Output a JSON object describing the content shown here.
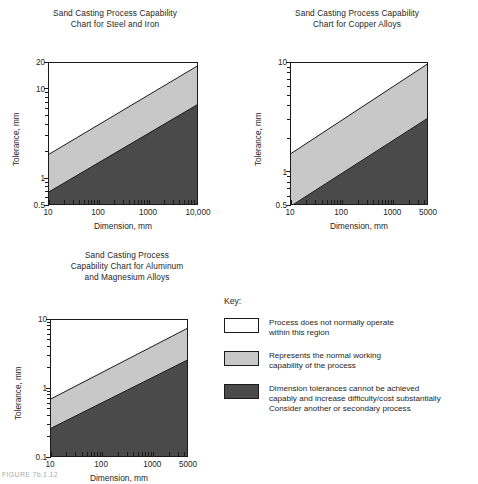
{
  "figure": {
    "footer_fragment": "FIGURE 7b.1.12"
  },
  "palette": {
    "white_region": "#ffffff",
    "normal_region": "#c8c8c8",
    "difficult_region": "#4a4a4a",
    "line": "#1a1a1a",
    "text": "#262626"
  },
  "key": {
    "title": "Key:",
    "items": [
      {
        "swatch": "#ffffff",
        "text": "Process does not normally operate\nwithin this region"
      },
      {
        "swatch": "#c8c8c8",
        "text": "Represents the normal working\ncapability of the process"
      },
      {
        "swatch": "#4a4a4a",
        "text": "Dimension tolerances cannot be achieved\ncapably and increase difficulty/cost substantially\nConsider another or secondary process"
      }
    ]
  },
  "chart_data": [
    {
      "id": "steel-and-iron",
      "type": "area",
      "title": "Sand Casting Process Capability\nChart for Steel and Iron",
      "xlabel": "Dimension, mm",
      "ylabel": "Tolerance, mm",
      "xscale": "log",
      "yscale": "log",
      "xlim": [
        10,
        10000
      ],
      "ylim": [
        0.5,
        20
      ],
      "xticks": [
        10,
        100,
        1000,
        10000
      ],
      "xticklabels": [
        "10",
        "100",
        "1000",
        "10,000"
      ],
      "yticks": [
        0.5,
        1,
        10,
        20
      ],
      "yticklabels": [
        "0.5",
        "1",
        "10",
        "20"
      ],
      "grid": false,
      "legend": "external-key",
      "boundaries": [
        {
          "name": "upper boundary (white / normal working)",
          "points": [
            [
              10,
              1.9
            ],
            [
              10000,
              19.0
            ]
          ]
        },
        {
          "name": "lower boundary (normal working / difficult)",
          "points": [
            [
              10,
              0.72
            ],
            [
              10000,
              7.0
            ]
          ]
        }
      ],
      "regions": [
        {
          "name": "Process does not normally operate",
          "fill": "#ffffff"
        },
        {
          "name": "Normal working capability",
          "fill": "#c8c8c8"
        },
        {
          "name": "Tolerances cannot be achieved capably",
          "fill": "#4a4a4a"
        }
      ]
    },
    {
      "id": "copper-alloys",
      "type": "area",
      "title": "Sand Casting Process Capability\nChart for Copper Alloys",
      "xlabel": "Dimension, mm",
      "ylabel": "Tolerance, mm",
      "xscale": "log",
      "yscale": "log",
      "xlim": [
        10,
        5000
      ],
      "ylim": [
        0.5,
        10
      ],
      "xticks": [
        10,
        100,
        1000,
        5000
      ],
      "xticklabels": [
        "10",
        "100",
        "1000",
        "5000"
      ],
      "yticks": [
        0.5,
        1,
        10
      ],
      "yticklabels": [
        "0.5",
        "1",
        "10"
      ],
      "grid": false,
      "legend": "external-key",
      "boundaries": [
        {
          "name": "upper boundary (white / normal working)",
          "points": [
            [
              10,
              1.5
            ],
            [
              5000,
              10.0
            ]
          ]
        },
        {
          "name": "lower boundary (normal working / difficult)",
          "points": [
            [
              10,
              0.5
            ],
            [
              5000,
              3.2
            ]
          ]
        }
      ],
      "regions": [
        {
          "name": "Process does not normally operate",
          "fill": "#ffffff"
        },
        {
          "name": "Normal working capability",
          "fill": "#c8c8c8"
        },
        {
          "name": "Tolerances cannot be achieved capably",
          "fill": "#4a4a4a"
        }
      ]
    },
    {
      "id": "aluminum-and-magnesium-alloys",
      "type": "area",
      "title": "Sand Casting Process\nCapability Chart for Aluminum\nand Magnesium Alloys",
      "xlabel": "Dimension, mm",
      "ylabel": "Tolerance, mm",
      "xscale": "log",
      "yscale": "log",
      "xlim": [
        10,
        5000
      ],
      "ylim": [
        0.1,
        10
      ],
      "xticks": [
        10,
        100,
        1000,
        5000
      ],
      "xticklabels": [
        "10",
        "100",
        "1000",
        "5000"
      ],
      "yticks": [
        0.1,
        1,
        10
      ],
      "yticklabels": [
        "0.1",
        "1",
        "10"
      ],
      "grid": false,
      "legend": "external-key",
      "boundaries": [
        {
          "name": "upper boundary (white / normal working)",
          "points": [
            [
              10,
              0.72
            ],
            [
              5000,
              7.8
            ]
          ]
        },
        {
          "name": "lower boundary (normal working / difficult)",
          "points": [
            [
              10,
              0.27
            ],
            [
              5000,
              2.7
            ]
          ]
        }
      ],
      "regions": [
        {
          "name": "Process does not normally operate",
          "fill": "#ffffff"
        },
        {
          "name": "Normal working capability",
          "fill": "#c8c8c8"
        },
        {
          "name": "Tolerances cannot be achieved capably",
          "fill": "#4a4a4a"
        }
      ]
    }
  ]
}
